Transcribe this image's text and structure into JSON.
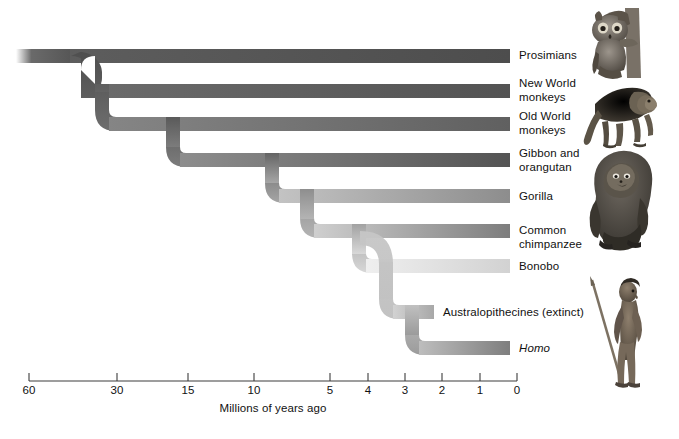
{
  "figure": {
    "type": "phylogenetic-tree",
    "axis": {
      "title": "Millions of years ago",
      "ticks": [
        {
          "label": "60",
          "value": 60,
          "x": 29
        },
        {
          "label": "30",
          "value": 30,
          "x": 117
        },
        {
          "label": "15",
          "value": 15,
          "x": 188
        },
        {
          "label": "10",
          "value": 10,
          "x": 254
        },
        {
          "label": "5",
          "value": 5,
          "x": 330
        },
        {
          "label": "4",
          "value": 4,
          "x": 368
        },
        {
          "label": "3",
          "value": 3,
          "x": 405
        },
        {
          "label": "2",
          "value": 2,
          "x": 442
        },
        {
          "label": "1",
          "value": 1,
          "x": 480
        },
        {
          "label": "0",
          "value": 0,
          "x": 517
        }
      ],
      "line_left_x": 29,
      "line_right_x": 517,
      "line_y": 381
    },
    "branches": [
      {
        "name": "prosimians",
        "label": "Prosimians",
        "italic": false,
        "tip_y": 56,
        "tip_end_x": 510,
        "split_x": 78,
        "color": "#5a5a5a",
        "label_x": 519,
        "label_y": 49
      },
      {
        "name": "new-world-monkeys",
        "label": "New World\nmonkeys",
        "italic": false,
        "tip_y": 91,
        "tip_end_x": 510,
        "split_x": 95,
        "color": "#5e5e5e",
        "label_x": 519,
        "label_y": 77
      },
      {
        "name": "old-world-monkeys",
        "label": "Old World\nmonkeys",
        "italic": false,
        "tip_y": 124,
        "tip_end_x": 510,
        "split_x": 166,
        "color": "#6f6f6f",
        "label_x": 519,
        "label_y": 110
      },
      {
        "name": "gibbon-and-orangutan",
        "label": "Gibbon and\norangutan",
        "italic": false,
        "tip_y": 160,
        "tip_end_x": 510,
        "split_x": 265,
        "color": "#6b6b6b",
        "label_x": 519,
        "label_y": 147
      },
      {
        "name": "gorilla",
        "label": "Gorilla",
        "italic": false,
        "tip_y": 196,
        "tip_end_x": 510,
        "split_x": 300,
        "color": "#9a9a9a",
        "label_x": 519,
        "label_y": 190
      },
      {
        "name": "common-chimpanzee",
        "label": "Common\nchimpanzee",
        "italic": false,
        "tip_y": 231,
        "tip_end_x": 510,
        "split_x": 352,
        "color": "#8b8b8b",
        "label_x": 519,
        "label_y": 224
      },
      {
        "name": "bonobo",
        "label": "Bonobo",
        "italic": false,
        "tip_y": 266,
        "tip_end_x": 510,
        "split_x": 392,
        "color": "#dcdcdc",
        "label_x": 519,
        "label_y": 260
      },
      {
        "name": "australopithecines",
        "label": "Australopithecines (extinct)",
        "italic": false,
        "tip_y": 312,
        "tip_end_x": 434,
        "split_x": 405,
        "color": "#b3b3b3",
        "label_x": 443,
        "label_y": 306
      },
      {
        "name": "homo",
        "label": "Homo",
        "italic": true,
        "tip_y": 348,
        "tip_end_x": 510,
        "split_x": 405,
        "color": "#8f8f8f",
        "label_x": 519,
        "label_y": 342
      }
    ],
    "root": {
      "start_x": 22,
      "y": 56
    },
    "illustrations": [
      {
        "name": "tarsier",
        "alt": "tarsier clinging to branch",
        "x": 583,
        "y": 6,
        "w": 56,
        "h": 72
      },
      {
        "name": "baboon",
        "alt": "baboon walking",
        "x": 578,
        "y": 82,
        "w": 72,
        "h": 62
      },
      {
        "name": "gorilla",
        "alt": "gorilla seated",
        "x": 582,
        "y": 152,
        "w": 68,
        "h": 98
      },
      {
        "name": "hominid",
        "alt": "early human with spear",
        "x": 590,
        "y": 274,
        "w": 58,
        "h": 112
      }
    ],
    "caption_fragment": ""
  }
}
